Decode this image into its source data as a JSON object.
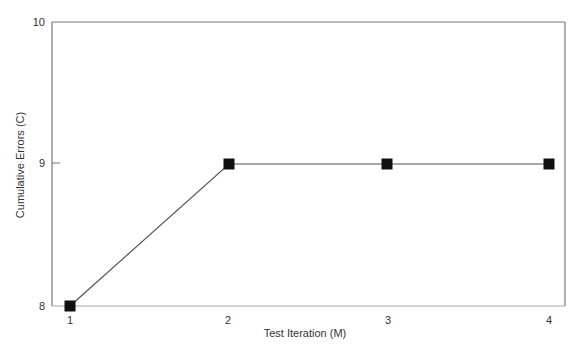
{
  "chart_data": {
    "type": "line",
    "title": "",
    "xlabel": "Test Iteration (M)",
    "ylabel": "Cumulative Errors (C)",
    "x": [
      1,
      2,
      3,
      4
    ],
    "categories": [
      "1",
      "2",
      "3",
      "4"
    ],
    "series": [
      {
        "name": "Cumulative Errors",
        "values": [
          8,
          9,
          9,
          9
        ],
        "marker": "square",
        "color": "#111111"
      }
    ],
    "xticks": [
      "1",
      "2",
      "3",
      "4"
    ],
    "yticks": [
      "8",
      "9",
      "10"
    ],
    "ylim": [
      8,
      10
    ],
    "xlim": [
      1,
      4
    ],
    "grid": false,
    "legend": null
  },
  "colors": {
    "frame": "#777777",
    "line": "#555555",
    "marker": "#111111"
  }
}
